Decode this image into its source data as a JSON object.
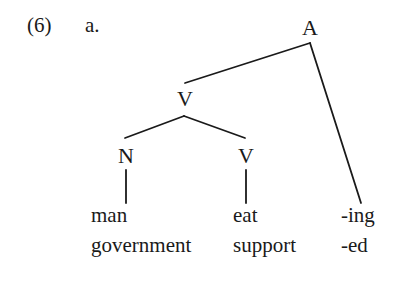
{
  "example": {
    "number": "(6)",
    "sub_label": "a."
  },
  "tree": {
    "nodes": {
      "root": "A",
      "left_child": "V",
      "noun": "N",
      "verb": "V"
    },
    "leaves": {
      "noun_row1": "man",
      "noun_row2": "government",
      "verb_row1": "eat",
      "verb_row2": "support",
      "suffix_row1": "-ing",
      "suffix_row2": "-ed"
    },
    "edges": [
      {
        "from": "A",
        "to": "V",
        "x1": 310,
        "y1": 43,
        "x2": 185,
        "y2": 83
      },
      {
        "from": "A",
        "to": "suffix",
        "x1": 310,
        "y1": 43,
        "x2": 361,
        "y2": 203
      },
      {
        "from": "V",
        "to": "N",
        "x1": 184,
        "y1": 116,
        "x2": 125,
        "y2": 138
      },
      {
        "from": "V",
        "to": "V",
        "x1": 184,
        "y1": 116,
        "x2": 245,
        "y2": 138
      },
      {
        "from": "N",
        "to": "noun-leaf",
        "x1": 126,
        "y1": 170,
        "x2": 126,
        "y2": 203
      },
      {
        "from": "V",
        "to": "verb-leaf",
        "x1": 246,
        "y1": 170,
        "x2": 246,
        "y2": 203
      }
    ]
  }
}
